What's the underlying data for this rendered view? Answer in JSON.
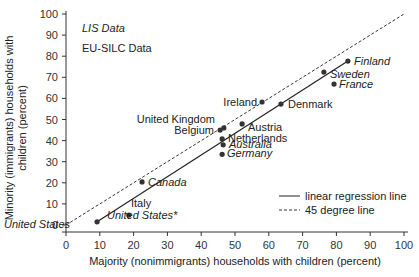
{
  "chart_data": {
    "type": "scatter",
    "title": "",
    "xlabel": "Majority (nonimmigrants) households with children (percent)",
    "ylabel_lines": [
      "Minority (immigrants) households with",
      "children (percent)"
    ],
    "ylabel": "Minority (immigrants) households with children (percent)",
    "xlim": [
      0,
      100
    ],
    "ylim": [
      0,
      100
    ],
    "x_ticks": [
      0,
      10,
      20,
      30,
      40,
      50,
      60,
      70,
      80,
      90,
      100
    ],
    "y_ticks": [
      0,
      10,
      20,
      30,
      40,
      50,
      60,
      70,
      80,
      90,
      100
    ],
    "grid": false,
    "sources": [
      {
        "label": "LIS Data",
        "italic": true
      },
      {
        "label": "EU-SILC Data",
        "italic": false
      }
    ],
    "points": [
      {
        "label": "United States",
        "x": 9.2,
        "y": 1.5,
        "source": "LIS",
        "italic": true,
        "lx": 4,
        "ly": 228,
        "anchor": "start"
      },
      {
        "label": "United States*",
        "x": 18.6,
        "y": 4.7,
        "source": "LIS",
        "italic": true,
        "lx": 107,
        "ly": 219,
        "anchor": "start"
      },
      {
        "label": "Italy",
        "x": 18.6,
        "y": 4.7,
        "source": "EU-SILC",
        "italic": false,
        "lx": 131,
        "ly": 207,
        "anchor": "start",
        "no_marker": true
      },
      {
        "label": "Canada",
        "x": 22.5,
        "y": 20.4,
        "source": "LIS",
        "italic": true,
        "lx": 148,
        "ly": 186,
        "anchor": "start"
      },
      {
        "label": "Germany",
        "x": 46.2,
        "y": 33.5,
        "source": "LIS",
        "italic": true,
        "lx": 227,
        "ly": 157,
        "anchor": "start"
      },
      {
        "label": "Australia",
        "x": 46.5,
        "y": 38.0,
        "source": "LIS",
        "italic": true,
        "lx": 229,
        "ly": 148,
        "anchor": "start"
      },
      {
        "label": "Netherlands",
        "x": 46.2,
        "y": 40.8,
        "source": "EU-SILC",
        "italic": false,
        "lx": 228,
        "ly": 142,
        "anchor": "start"
      },
      {
        "label": "Belgium",
        "x": 45.6,
        "y": 45.0,
        "source": "EU-SILC",
        "italic": false,
        "lx": 214,
        "ly": 134,
        "anchor": "end"
      },
      {
        "label": "United Kingdom",
        "x": 46.7,
        "y": 46.0,
        "source": "EU-SILC",
        "italic": false,
        "lx": 215,
        "ly": 123,
        "anchor": "end"
      },
      {
        "label": "Austria",
        "x": 52.1,
        "y": 47.9,
        "source": "EU-SILC",
        "italic": false,
        "lx": 248,
        "ly": 131,
        "anchor": "start"
      },
      {
        "label": "Ireland",
        "x": 58.0,
        "y": 58.3,
        "source": "EU-SILC",
        "italic": false,
        "lx": 257,
        "ly": 106,
        "anchor": "end"
      },
      {
        "label": "Denmark",
        "x": 63.6,
        "y": 57.3,
        "source": "EU-SILC",
        "italic": false,
        "lx": 288,
        "ly": 108,
        "anchor": "start"
      },
      {
        "label": "France",
        "x": 79.3,
        "y": 66.8,
        "source": "EU-SILC",
        "italic": true,
        "lx": 339,
        "ly": 88,
        "anchor": "start"
      },
      {
        "label": "Sweden",
        "x": 76.3,
        "y": 72.5,
        "source": "LIS",
        "italic": true,
        "lx": 330,
        "ly": 78,
        "anchor": "start"
      },
      {
        "label": "Finland",
        "x": 83.4,
        "y": 77.7,
        "source": "LIS",
        "italic": true,
        "lx": 354,
        "ly": 65,
        "anchor": "start"
      }
    ],
    "regression_line": {
      "x1": 9.2,
      "y1": 1.5,
      "x2": 83.4,
      "y2": 77.7
    },
    "reference_line": {
      "x1": 0,
      "y1": 0,
      "x2": 100,
      "y2": 100
    },
    "legend": {
      "position": "lower right",
      "entries": [
        {
          "label": "linear regression line",
          "style": "solid"
        },
        {
          "label": "45 degree line",
          "style": "dashed"
        }
      ]
    }
  },
  "colors": {
    "axis": "#333333",
    "marker": "#333333",
    "line": "#222222",
    "text": "#222222"
  }
}
